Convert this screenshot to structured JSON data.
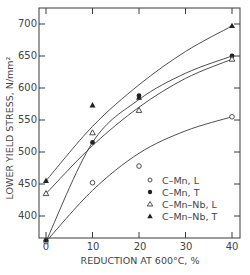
{
  "chart_data": {
    "type": "scatter",
    "title": "",
    "xlabel": "REDUCTION AT 600°C, %",
    "ylabel": "LOWER YIELD STRESS, N/mm²",
    "xlim": [
      0,
      40
    ],
    "ylim": [
      350,
      720
    ],
    "x_ticks": [
      0,
      10,
      20,
      30,
      40
    ],
    "y_ticks": [
      400,
      450,
      500,
      550,
      600,
      650,
      700
    ],
    "grid": false,
    "legend_position": "lower right (inside)",
    "series": [
      {
        "name": "C-Mn, L",
        "marker": "open-circle",
        "x": [
          0,
          10,
          20,
          40
        ],
        "y": [
          360,
          452,
          478,
          555
        ]
      },
      {
        "name": "C-Mn, T",
        "marker": "filled-circle",
        "x": [
          0,
          10,
          20,
          40
        ],
        "y": [
          362,
          515,
          588,
          650
        ]
      },
      {
        "name": "C-Mn-Nb, L",
        "marker": "open-triangle",
        "x": [
          0,
          10,
          20,
          40
        ],
        "y": [
          435,
          530,
          565,
          645
        ]
      },
      {
        "name": "C-Mn-Nb, T",
        "marker": "filled-triangle",
        "x": [
          0,
          10,
          20,
          40
        ],
        "y": [
          455,
          573,
          585,
          697
        ]
      }
    ],
    "fitted_curves": [
      {
        "series": "C-Mn, L",
        "points": [
          [
            0,
            360
          ],
          [
            10,
            440
          ],
          [
            20,
            498
          ],
          [
            30,
            533
          ],
          [
            40,
            555
          ]
        ]
      },
      {
        "series": "C-Mn, T",
        "points": [
          [
            0,
            360
          ],
          [
            10,
            515
          ],
          [
            20,
            582
          ],
          [
            30,
            623
          ],
          [
            40,
            650
          ]
        ]
      },
      {
        "series": "C-Mn-Nb, L",
        "points": [
          [
            0,
            435
          ],
          [
            10,
            510
          ],
          [
            20,
            570
          ],
          [
            30,
            615
          ],
          [
            40,
            645
          ]
        ]
      },
      {
        "series": "C-Mn-Nb, T",
        "points": [
          [
            0,
            455
          ],
          [
            10,
            540
          ],
          [
            20,
            605
          ],
          [
            30,
            657
          ],
          [
            40,
            697
          ]
        ]
      }
    ]
  },
  "axes": {
    "x_label": "REDUCTION AT 600°C, %",
    "y_label": "LOWER YIELD STRESS, N/mm²",
    "x_tick_labels": [
      "0",
      "10",
      "20",
      "30",
      "40"
    ],
    "y_tick_labels": [
      "400",
      "450",
      "500",
      "550",
      "600",
      "650",
      "700"
    ]
  },
  "legend": {
    "items": [
      {
        "symbol": "o",
        "label": "C–Mn, L"
      },
      {
        "symbol": "●",
        "label": "C–Mn, T"
      },
      {
        "symbol": "Δ",
        "label": "C–Mn–Nb, L"
      },
      {
        "symbol": "▲",
        "label": "C–Mn–Nb, T"
      }
    ]
  },
  "colors": {
    "ink": "#3a3a3a",
    "background": "#ffffff"
  }
}
